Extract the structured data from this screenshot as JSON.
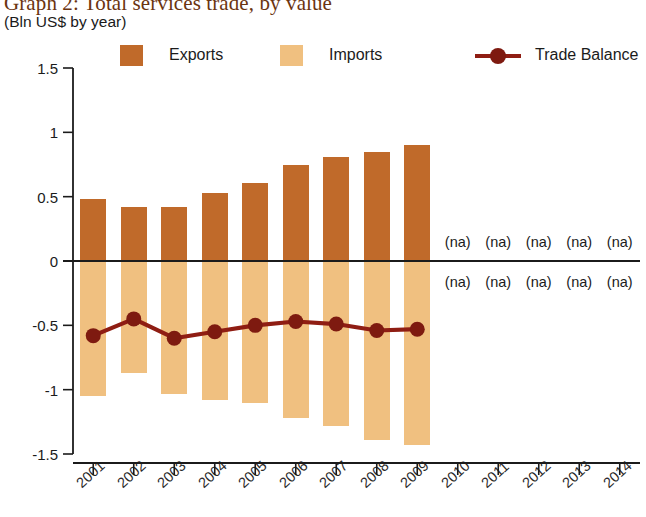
{
  "title": "Graph 2: Total services trade, by value",
  "subtitle": "(Bln US$ by year)",
  "legend": [
    {
      "key": "exports",
      "label": "Exports",
      "type": "swatch",
      "color": "#C06A2A"
    },
    {
      "key": "imports",
      "label": "Imports",
      "type": "swatch",
      "color": "#F0C080"
    },
    {
      "key": "balance",
      "label": "Trade Balance",
      "type": "line",
      "color": "#8F1D13"
    }
  ],
  "na_text": "(na)",
  "colors": {
    "exports": "#C06A2A",
    "imports": "#F0C080",
    "balance_line": "#8F1D13",
    "balance_marker": "#7E1A10",
    "axis": "#1B1B1B",
    "title": "#6B3410",
    "background": "#FFFFFF"
  },
  "chart_data": {
    "type": "bar",
    "title": "Graph 2: Total services trade, by value",
    "subtitle": "(Bln US$ by year)",
    "xlabel": "",
    "ylabel": "Bln US$ by year",
    "ylim": [
      -1.5,
      1.5
    ],
    "yticks": [
      1.5,
      1,
      0.5,
      0,
      -0.5,
      -1,
      -1.5
    ],
    "ytick_labels": [
      "1.5",
      "1",
      "0.5",
      "0",
      "-0.5",
      "-1",
      "-1.5"
    ],
    "grid": false,
    "legend_position": "top",
    "categories": [
      "2001",
      "2002",
      "2003",
      "2004",
      "2005",
      "2006",
      "2007",
      "2008",
      "2009",
      "2010",
      "2011",
      "2012",
      "2013",
      "2014"
    ],
    "series": [
      {
        "name": "Exports",
        "type": "bar",
        "color": "#C06A2A",
        "values": [
          0.48,
          0.42,
          0.42,
          0.53,
          0.61,
          0.75,
          0.81,
          0.85,
          0.9,
          null,
          null,
          null,
          null,
          null
        ]
      },
      {
        "name": "Imports",
        "type": "bar",
        "color": "#F0C080",
        "values": [
          -1.05,
          -0.87,
          -1.03,
          -1.08,
          -1.1,
          -1.22,
          -1.28,
          -1.39,
          -1.43,
          null,
          null,
          null,
          null,
          null
        ]
      },
      {
        "name": "Trade Balance",
        "type": "line",
        "color": "#8F1D13",
        "values": [
          -0.58,
          -0.45,
          -0.6,
          -0.55,
          -0.5,
          -0.47,
          -0.49,
          -0.54,
          -0.53,
          null,
          null,
          null,
          null,
          null
        ]
      }
    ],
    "missing_label": "(na)",
    "missing_categories": [
      "2010",
      "2011",
      "2012",
      "2013",
      "2014"
    ],
    "annotations": [
      {
        "text": "(na)",
        "category": "2010",
        "position": "above-axis"
      },
      {
        "text": "(na)",
        "category": "2011",
        "position": "above-axis"
      },
      {
        "text": "(na)",
        "category": "2012",
        "position": "above-axis"
      },
      {
        "text": "(na)",
        "category": "2013",
        "position": "above-axis"
      },
      {
        "text": "(na)",
        "category": "2014",
        "position": "above-axis"
      },
      {
        "text": "(na)",
        "category": "2010",
        "position": "below-axis"
      },
      {
        "text": "(na)",
        "category": "2011",
        "position": "below-axis"
      },
      {
        "text": "(na)",
        "category": "2012",
        "position": "below-axis"
      },
      {
        "text": "(na)",
        "category": "2013",
        "position": "below-axis"
      },
      {
        "text": "(na)",
        "category": "2014",
        "position": "below-axis"
      }
    ]
  }
}
